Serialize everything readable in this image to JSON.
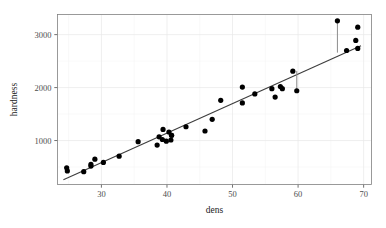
{
  "chart_data": {
    "type": "scatter",
    "title": "",
    "xlabel": "dens",
    "ylabel": "hardness",
    "xlim": [
      23.3,
      71.2
    ],
    "ylim": [
      170,
      3380
    ],
    "grid": true,
    "legend": null,
    "x_ticks": [
      30,
      40,
      50,
      60,
      70
    ],
    "x_tick_labels": [
      "30",
      "40",
      "50",
      "60",
      "70"
    ],
    "x_minor_ticks": [
      25,
      35,
      45,
      55,
      65
    ],
    "y_ticks": [
      1000,
      2000,
      3000
    ],
    "y_tick_labels": [
      "1000",
      "2000",
      "3000"
    ],
    "y_minor_ticks": [
      500,
      1500,
      2500
    ],
    "point_color": "#000000",
    "line_color": "#3d3d3d",
    "residual_color": "#8c8c8c",
    "panel_border_color": "#808080",
    "grid_color": "#e8e8e8",
    "points": [
      {
        "x": 24.7,
        "y": 484
      },
      {
        "x": 24.8,
        "y": 427
      },
      {
        "x": 27.3,
        "y": 413
      },
      {
        "x": 28.4,
        "y": 517
      },
      {
        "x": 28.4,
        "y": 549
      },
      {
        "x": 29.0,
        "y": 648
      },
      {
        "x": 30.3,
        "y": 587
      },
      {
        "x": 32.7,
        "y": 704
      },
      {
        "x": 35.6,
        "y": 979
      },
      {
        "x": 38.5,
        "y": 914
      },
      {
        "x": 38.8,
        "y": 1070
      },
      {
        "x": 39.3,
        "y": 1020
      },
      {
        "x": 39.4,
        "y": 1210
      },
      {
        "x": 39.9,
        "y": 989
      },
      {
        "x": 40.3,
        "y": 1160
      },
      {
        "x": 40.6,
        "y": 1010
      },
      {
        "x": 40.7,
        "y": 1100
      },
      {
        "x": 40.7,
        "y": 1100
      },
      {
        "x": 42.9,
        "y": 1260
      },
      {
        "x": 45.8,
        "y": 1180
      },
      {
        "x": 46.9,
        "y": 1400
      },
      {
        "x": 48.2,
        "y": 1760
      },
      {
        "x": 51.5,
        "y": 1710
      },
      {
        "x": 51.5,
        "y": 2010
      },
      {
        "x": 53.4,
        "y": 1880
      },
      {
        "x": 56.0,
        "y": 1980
      },
      {
        "x": 56.5,
        "y": 1820
      },
      {
        "x": 57.3,
        "y": 2020
      },
      {
        "x": 57.6,
        "y": 1980
      },
      {
        "x": 59.2,
        "y": 2310
      },
      {
        "x": 59.8,
        "y": 1940
      },
      {
        "x": 66.0,
        "y": 3260
      },
      {
        "x": 67.4,
        "y": 2700
      },
      {
        "x": 68.8,
        "y": 2890
      },
      {
        "x": 69.1,
        "y": 2740
      },
      {
        "x": 69.1,
        "y": 3140
      }
    ],
    "fit_line": {
      "label": "linear fit",
      "x_start": 24.2,
      "y_start": 260,
      "x_end": 69.6,
      "y_end": 2790
    },
    "residual_segments": [
      {
        "x": 66.0,
        "y_fit": 2660,
        "y_obs": 3260
      },
      {
        "x": 59.8,
        "y_fit": 2315,
        "y_obs": 1940
      }
    ]
  }
}
